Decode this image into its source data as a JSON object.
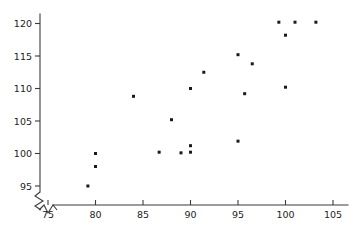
{
  "chart_data": {
    "type": "scatter",
    "title": "",
    "subtitle": "",
    "xlabel": "",
    "ylabel": "",
    "xlim": [
      74,
      106.5
    ],
    "ylim": [
      93.5,
      121.8
    ],
    "grid": false,
    "legend": null,
    "axis_break": {
      "axis": "both",
      "symbol": "zigzag",
      "note": "broken-axis zigzag glyph near origin"
    },
    "xticks": [
      75,
      80,
      85,
      90,
      95,
      100,
      105
    ],
    "xtick_labels": [
      "75",
      "80",
      "85",
      "90",
      "95",
      "100",
      "105"
    ],
    "yticks": [
      95,
      100,
      105,
      110,
      115,
      120
    ],
    "ytick_labels": [
      "95",
      "100",
      "105",
      "110",
      "115",
      "120"
    ],
    "marker": {
      "shape": "square",
      "size": 3,
      "color": "#1a1a1a"
    },
    "points": [
      {
        "x": 79.2,
        "y": 95.0
      },
      {
        "x": 80.0,
        "y": 98.0
      },
      {
        "x": 80.0,
        "y": 100.0
      },
      {
        "x": 84.0,
        "y": 108.8
      },
      {
        "x": 86.7,
        "y": 100.2
      },
      {
        "x": 88.0,
        "y": 105.2
      },
      {
        "x": 89.0,
        "y": 100.1
      },
      {
        "x": 90.0,
        "y": 100.2
      },
      {
        "x": 90.0,
        "y": 101.2
      },
      {
        "x": 90.0,
        "y": 110.0
      },
      {
        "x": 91.4,
        "y": 112.5
      },
      {
        "x": 95.0,
        "y": 101.9
      },
      {
        "x": 95.0,
        "y": 115.2
      },
      {
        "x": 95.7,
        "y": 109.2
      },
      {
        "x": 96.5,
        "y": 113.8
      },
      {
        "x": 99.3,
        "y": 120.2
      },
      {
        "x": 100.0,
        "y": 110.2
      },
      {
        "x": 100.0,
        "y": 118.2
      },
      {
        "x": 101.0,
        "y": 120.2
      },
      {
        "x": 103.2,
        "y": 120.2
      }
    ]
  }
}
